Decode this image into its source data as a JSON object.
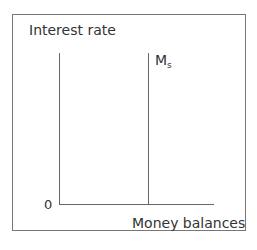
{
  "diagram": {
    "y_axis_label": "Interest rate",
    "x_axis_label": "Money balances",
    "origin_label": "0",
    "curve_label_main": "M",
    "curve_label_sub": "s"
  }
}
